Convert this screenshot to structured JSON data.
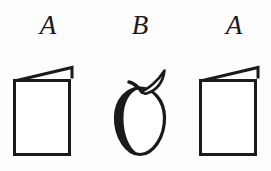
{
  "figure": {
    "background_color": "#fdfdfd",
    "ink_color": "#1a1a1a",
    "pattern": "ABA",
    "items": [
      {
        "label": "A",
        "glyph": "folded-card-icon",
        "description": "folded greeting card with slanted top flap"
      },
      {
        "label": "B",
        "glyph": "apple-icon",
        "description": "apple outline with stem and leaf, shaded left edge"
      },
      {
        "label": "A",
        "glyph": "folded-card-icon",
        "description": "folded greeting card with slanted top flap"
      }
    ]
  }
}
